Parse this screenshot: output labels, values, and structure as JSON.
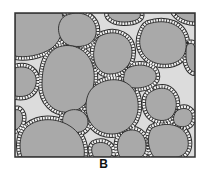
{
  "figure": {
    "panel_label": "B",
    "frame": {
      "x": 15,
      "y": 13,
      "width": 180,
      "height": 144
    },
    "colors": {
      "pore": "#dcdcdc",
      "grain": "#a9a9a9",
      "grain_outline": "#2a2a2a",
      "rim": "#f2f2f2",
      "rim_outline": "#2a2a2a",
      "frame": "#333333"
    },
    "legend": {
      "grain": "grain",
      "rim": "cement rim",
      "pore": "pore space"
    }
  }
}
